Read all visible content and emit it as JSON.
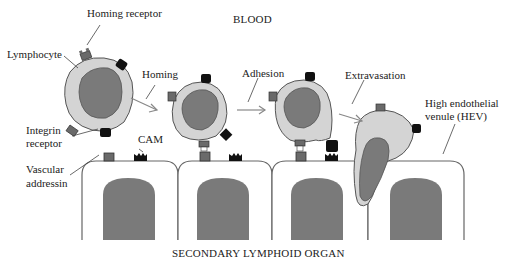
{
  "diagram": {
    "region_top": "BLOOD",
    "region_bottom": "SECONDARY LYMPHOID ORGAN",
    "labels": {
      "homing_receptor": "Homing receptor",
      "lymphocyte": "Lymphocyte",
      "integrin_line1": "Integrin",
      "integrin_line2": "receptor",
      "cam": "CAM",
      "vascular_line1": "Vascular",
      "vascular_line2": "addressin",
      "hev_line1": "High endothelial",
      "hev_line2": "venule (HEV)"
    },
    "steps": [
      "Homing",
      "Adhesion",
      "Extravasation"
    ],
    "colors": {
      "cytoplasm": "#d4d4d4",
      "nucleus": "#7a7a7a",
      "outline": "#555555",
      "homing_receptor": "#6a6a6a",
      "integrin": "#111111",
      "arrow": "#888888",
      "endothelium_fill": "#ffffff"
    }
  }
}
